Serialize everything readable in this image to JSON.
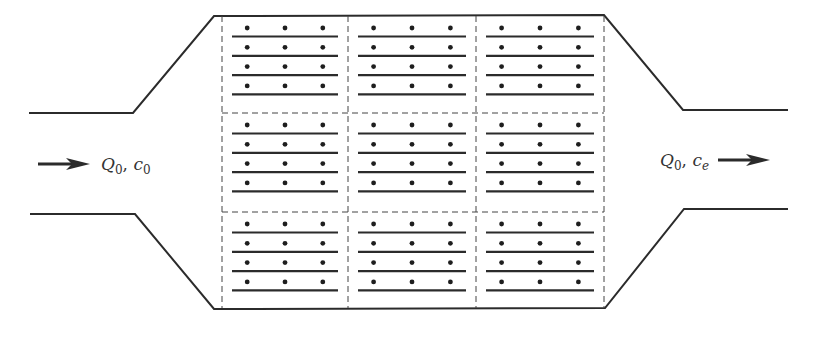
{
  "diagram": {
    "type": "settling-chamber / electrostatic precipitator plan view",
    "colors": {
      "line": "#2b2b2b",
      "dashed": "#444444",
      "particle": "#1e1e1e",
      "background": "#ffffff"
    },
    "inlet": {
      "label": {
        "symbol": "Q",
        "symbol_sub": "0",
        "sep": ", ",
        "conc": "c",
        "conc_sub": "0"
      },
      "arrow_direction": "right"
    },
    "outlet": {
      "label": {
        "symbol": "Q",
        "symbol_sub": "0",
        "sep": ", ",
        "conc": "c",
        "conc_sub": "e"
      },
      "arrow_direction": "right"
    },
    "chamber": {
      "grid": {
        "rows": 3,
        "cols": 3
      },
      "plates_per_cell": 4,
      "particles_per_row": 3,
      "particle_rows_per_cell": 4
    }
  }
}
